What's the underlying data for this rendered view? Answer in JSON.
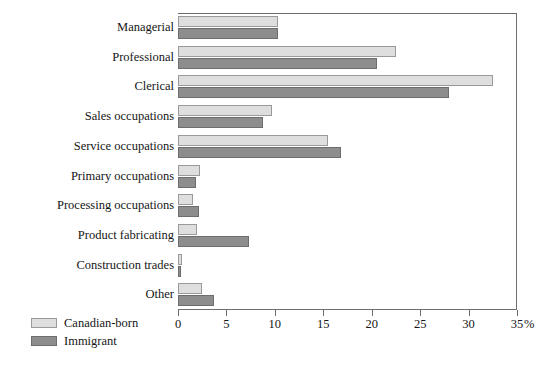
{
  "chart_data": {
    "type": "bar",
    "orientation": "horizontal",
    "title": "",
    "subtitle": "",
    "xlabel": "%",
    "ylabel": "",
    "xlim": [
      0,
      35
    ],
    "xticks": [
      0,
      5,
      10,
      15,
      20,
      25,
      30,
      35
    ],
    "xtick_labels": [
      "0",
      "5",
      "10",
      "15",
      "20",
      "25",
      "30",
      "35"
    ],
    "grid": false,
    "legend_position": "bottom-left",
    "categories": [
      "Managerial",
      "Professional",
      "Clerical",
      "Sales occupations",
      "Service occupations",
      "Primary occupations",
      "Processing occupations",
      "Product fabricating",
      "Construction trades",
      "Other"
    ],
    "series": [
      {
        "name": "Canadian-born",
        "color": "#dedede",
        "values": [
          10.3,
          22.5,
          32.5,
          9.7,
          15.5,
          2.3,
          1.6,
          2.0,
          0.4,
          2.5
        ]
      },
      {
        "name": "Immigrant",
        "color": "#8d8d8d",
        "values": [
          10.3,
          20.5,
          28.0,
          8.8,
          16.8,
          1.9,
          2.2,
          7.3,
          0.3,
          3.7
        ]
      }
    ]
  },
  "axis": {
    "unit_label": "%"
  },
  "colors": {
    "canadian_born": "#dedede",
    "immigrant": "#8d8d8d",
    "axis": "#6e6e6e",
    "text": "#161616",
    "background": "#ffffff"
  }
}
